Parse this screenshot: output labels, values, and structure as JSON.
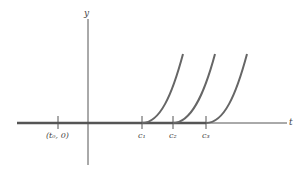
{
  "diagram": {
    "axes": {
      "x_label": "t",
      "y_label": "y"
    },
    "ticks": [
      {
        "label_parts": [
          "(t",
          "0",
          ", 0)"
        ],
        "label": "(t0, 0)",
        "x": 58
      },
      {
        "label": "c1",
        "x": 142
      },
      {
        "label": "c2",
        "x": 173
      },
      {
        "label": "c3",
        "x": 206
      }
    ],
    "tick_labels": {
      "t0": "(t₀, 0)",
      "c1": "c₁",
      "c2": "c₂",
      "c3": "c₃"
    },
    "curves": [
      {
        "name": "curve-c1",
        "start_x": 142,
        "end": [
          183,
          54
        ]
      },
      {
        "name": "curve-c2",
        "start_x": 173,
        "end": [
          215,
          54
        ]
      },
      {
        "name": "curve-c3",
        "start_x": 206,
        "end": [
          247,
          54
        ]
      }
    ],
    "colors": {
      "axis": "#555555",
      "curve": "#666666"
    }
  }
}
